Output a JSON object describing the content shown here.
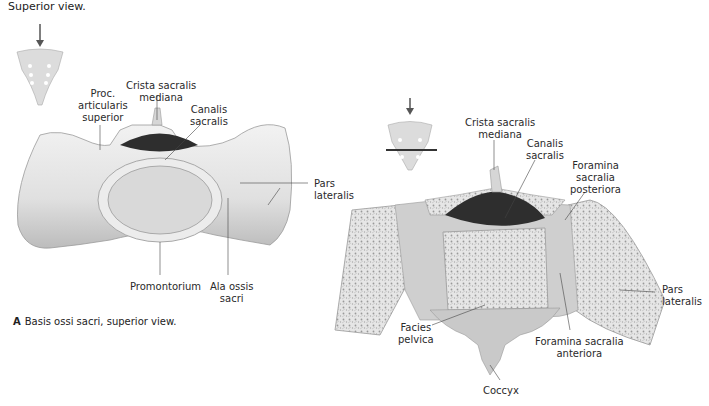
{
  "figure": {
    "subtitle": "Superior view.",
    "caption_letter": "A",
    "caption_text": "Basis ossi sacri, superior view."
  },
  "panel_a": {
    "labels": {
      "proc_articularis": [
        "Proc.",
        "articularis",
        "superior"
      ],
      "crista": [
        "Crista sacralis",
        "mediana"
      ],
      "canalis": [
        "Canalis",
        "sacralis"
      ],
      "pars_lateralis": [
        "Pars",
        "lateralis"
      ],
      "promontorium": "Promontorium",
      "ala": [
        "Ala ossis",
        "sacri"
      ]
    }
  },
  "panel_b": {
    "labels": {
      "crista": [
        "Crista sacralis",
        "mediana"
      ],
      "canalis": [
        "Canalis",
        "sacralis"
      ],
      "foramina_post": [
        "Foramina",
        "sacralia",
        "posteriora"
      ],
      "pars_lateralis": [
        "Pars",
        "lateralis"
      ],
      "facies": [
        "Facies",
        "pelvica"
      ],
      "foramina_ant": [
        "Foramina sacralia",
        "anteriora"
      ],
      "coccyx": "Coccyx"
    }
  },
  "colors": {
    "bone": "#e4e4e4",
    "bone_shade": "#bdbdbd",
    "canal": "#2e2e2e",
    "cancellous": "#d8d8d8",
    "arrow": "#555555",
    "leader": "#444444"
  }
}
